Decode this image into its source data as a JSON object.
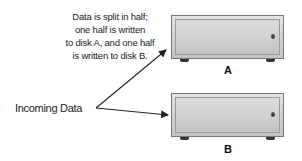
{
  "caption": {
    "lines": [
      "Data is split in half;",
      "one half is written",
      "to disk A, and one half",
      "is written to disk B."
    ]
  },
  "source": {
    "label": "Incoming Data"
  },
  "disks": [
    {
      "id": "A",
      "label": "A"
    },
    {
      "id": "B",
      "label": "B"
    }
  ],
  "colors": {
    "arrow": "#222222",
    "disk_border": "#777777",
    "disk_fill": "#d2d2d2",
    "text": "#222222"
  }
}
